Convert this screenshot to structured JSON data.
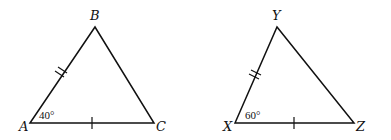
{
  "diagram": {
    "triangles": [
      {
        "name": "ABC",
        "vertices": {
          "A": "A",
          "B": "B",
          "C": "C"
        },
        "angle_label": "40°",
        "angle_at": "A",
        "marks": {
          "AB": "double-tick",
          "AC": "single-tick"
        }
      },
      {
        "name": "XYZ",
        "vertices": {
          "X": "X",
          "Y": "Y",
          "Z": "Z"
        },
        "angle_label": "60°",
        "angle_at": "X",
        "marks": {
          "XY": "double-tick",
          "XZ": "single-tick"
        }
      }
    ],
    "stroke_color": "#111111"
  }
}
